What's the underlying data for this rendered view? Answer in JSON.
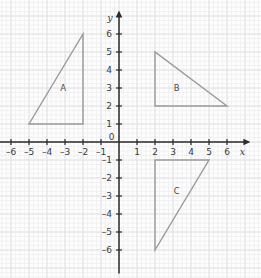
{
  "figure": {
    "kind": "coordinate-plane",
    "background_color": "#fdfdfd",
    "width": 261,
    "height": 278
  },
  "grid": {
    "minor_color": "#efeff1",
    "major_color": "#e2e2e6",
    "minor_step_units": 0.25,
    "major_step_units": 1,
    "px_per_unit": 18,
    "origin_px": {
      "x": 119,
      "y": 142
    },
    "visible": true
  },
  "axes": {
    "color": "#2b2b2b",
    "x": {
      "name": "x",
      "min": -6.9,
      "max": 7.3,
      "ticks": [
        -6,
        -5,
        -4,
        -3,
        -2,
        -1,
        1,
        2,
        3,
        4,
        5,
        6
      ],
      "tick_labels": [
        "–6",
        "–5",
        "–4",
        "–3",
        "–2",
        "–1",
        "1",
        "2",
        "3",
        "4",
        "5",
        "6"
      ]
    },
    "y": {
      "name": "y",
      "min": -7.3,
      "max": 7.3,
      "ticks": [
        6,
        5,
        4,
        3,
        2,
        1,
        -1,
        -2,
        -3,
        -4,
        -5,
        -6
      ],
      "tick_labels": [
        "6",
        "5",
        "4",
        "3",
        "2",
        "1",
        "–1",
        "–2",
        "–3",
        "–4",
        "–5",
        "–6"
      ]
    },
    "origin_label": "0"
  },
  "shapes": {
    "stroke_color": "#9a9a9a",
    "stroke_width": 1.4,
    "fill": "none",
    "triangles": [
      {
        "label": "A",
        "vertices": [
          [
            -5,
            1
          ],
          [
            -2,
            1
          ],
          [
            -2,
            6
          ]
        ],
        "label_position": [
          -3.1,
          3.0
        ]
      },
      {
        "label": "B",
        "vertices": [
          [
            2,
            5
          ],
          [
            2,
            2
          ],
          [
            6,
            2
          ]
        ],
        "label_position": [
          3.2,
          3.0
        ]
      },
      {
        "label": "C",
        "vertices": [
          [
            2,
            -1
          ],
          [
            5,
            -1
          ],
          [
            2,
            -6
          ]
        ],
        "label_position": [
          3.2,
          -2.7
        ]
      }
    ]
  }
}
